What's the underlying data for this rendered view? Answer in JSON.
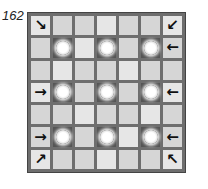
{
  "puzzle": {
    "number": "162",
    "grid_size": 7,
    "cells": [
      [
        "arrow-se",
        "",
        "",
        "",
        "",
        "",
        "arrow-sw"
      ],
      [
        "",
        "sun",
        "",
        "sun",
        "",
        "sun",
        "arrow-w"
      ],
      [
        "",
        "",
        "",
        "",
        "",
        "",
        ""
      ],
      [
        "arrow-e",
        "sun",
        "",
        "sun",
        "",
        "sun",
        "arrow-w"
      ],
      [
        "",
        "",
        "",
        "",
        "",
        "",
        ""
      ],
      [
        "arrow-e",
        "sun",
        "",
        "sun",
        "",
        "sun",
        "arrow-w"
      ],
      [
        "arrow-ne",
        "",
        "",
        "",
        "",
        "",
        "arrow-nw"
      ]
    ],
    "glyphs": {
      "arrow-se": "↘",
      "arrow-sw": "↙",
      "arrow-w": "←",
      "arrow-e": "→",
      "arrow-ne": "↗",
      "arrow-nw": "↖"
    }
  }
}
